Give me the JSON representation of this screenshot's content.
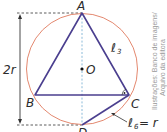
{
  "figure": {
    "type": "geometry",
    "points": {
      "A": {
        "label": "A"
      },
      "B": {
        "label": "B"
      },
      "C": {
        "label": "C"
      },
      "O": {
        "label": "O"
      },
      "D": {
        "label": "D"
      }
    },
    "labels": {
      "diameter": "2r",
      "side_triangle": "ℓ",
      "side_triangle_sub": "3",
      "side_hexagon": "ℓ",
      "side_hexagon_sub": "6",
      "side_hexagon_eq": "= r"
    },
    "credit_line1": "Ilustrações: Banco de imagens/",
    "credit_line2": "Arquivo da editora",
    "colors": {
      "circle": "#e07a5f",
      "triangle": "#4b3f8f",
      "axis": "#7fb3d5",
      "dashes": "#333333"
    }
  }
}
